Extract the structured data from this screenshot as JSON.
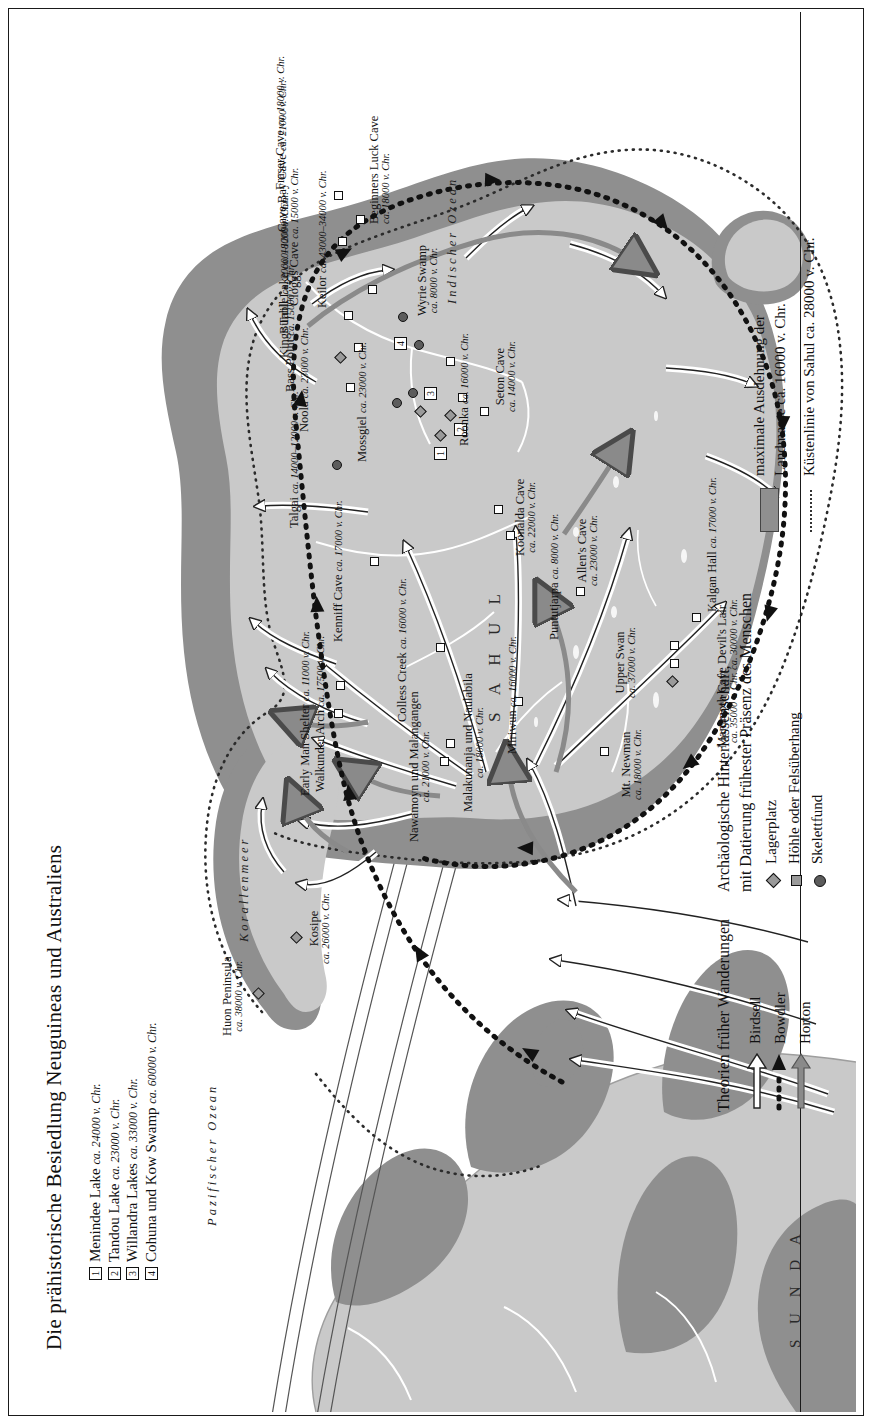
{
  "title": "Die prähistorische Besiedlung Neuguineas und Australiens",
  "numbered_list": [
    {
      "num": "1",
      "name": "Menindee Lake",
      "date": "ca. 24000 v. Chr."
    },
    {
      "num": "2",
      "name": "Tandou Lake",
      "date": "ca. 23000 v. Chr."
    },
    {
      "num": "3",
      "name": "Willandra Lakes",
      "date": "ca. 33000 v. Chr."
    },
    {
      "num": "4",
      "name": "Cohuna und Kow Swamp",
      "date": "ca. 60000 v. Chr."
    }
  ],
  "ocean_labels": {
    "pacific": "Pazifischer Ozean",
    "indian": "Indischer Ozean",
    "coral": "Korallenmeer"
  },
  "region_labels": {
    "sahul": "S A H U L",
    "sunda": "S U N D A"
  },
  "legend": {
    "migration_heading": "Theorien früher Wanderungen",
    "migration_items": [
      {
        "label": "Birdsell",
        "icon": "white-arrow-icon"
      },
      {
        "label": "Bowdler",
        "icon": "black-dotted-arrow-icon"
      },
      {
        "label": "Horton",
        "icon": "gray-arrow-icon"
      }
    ],
    "finds_heading_line1": "Archäologische Hinterlassenschaft,",
    "finds_heading_line2": "mit Datierung frühester Präsenz des Menschen",
    "finds_items": [
      {
        "label": "Lagerplatz",
        "icon": "diamond-marker-icon"
      },
      {
        "label": "Höhle oder Felsüberhang",
        "icon": "square-marker-icon"
      },
      {
        "label": "Skelettfund",
        "icon": "circle-marker-icon"
      }
    ],
    "landmass_line1": "maximale Ausdehnung der",
    "landmass_line2": "Landmasse ca. 16000 v. Chr.",
    "coastline": "Küstenlinie von Sahul ca. 28000 v. Chr."
  },
  "colors": {
    "land": "#c9c9c9",
    "shelf": "#8f8f8f",
    "ink": "#111111",
    "paper": "#ffffff"
  },
  "sites": [
    {
      "name": "Huon Peninsula",
      "date": "ca. 38000 v. Chr.",
      "type": "diamond"
    },
    {
      "name": "Kosipe",
      "date": "ca. 26000 v. Chr.",
      "type": "diamond"
    },
    {
      "name": "Early Man Shelter",
      "date": "ca. 11000 v. Chr.",
      "type": "square"
    },
    {
      "name": "Walkunder Arch",
      "date": "ca. 17500 v. Chr.",
      "type": "square"
    },
    {
      "name": "Kenniff Cave",
      "date": "ca. 17000 v. Chr.",
      "type": "square"
    },
    {
      "name": "Talgai",
      "date": "ca. 14000–12000 v. Chr.",
      "type": "circle"
    },
    {
      "name": "Noola",
      "date": "ca. 23000 v. Chr.",
      "type": "square"
    },
    {
      "name": "Bass Point",
      "date": "ca. 15000 v. Chr.",
      "type": "diamond"
    },
    {
      "name": "Kings Table",
      "date": "ca. 20000–12000 v. Chr.",
      "type": "square"
    },
    {
      "name": "Burrill Lake",
      "date": "ca. 18000 v. Chr.",
      "type": "square"
    },
    {
      "name": "Cloggs Cave",
      "date": "ca. 15000 v. Chr.",
      "type": "square"
    },
    {
      "name": "Keilor",
      "date": "ca. 43000–34000 v. Chr.",
      "type": "circle"
    },
    {
      "name": "Cave Bay Cave",
      "date": "ca. 21000 v. Chr.",
      "type": "square"
    },
    {
      "name": "Fraser Cave",
      "date": "ca. 18000 v. Chr.",
      "type": "square"
    },
    {
      "name": "Beginners Luck Cave",
      "date": "ca. 18000 v. Chr.",
      "type": "square"
    },
    {
      "name": "Mossgiel",
      "date": "ca. 23000 v. Chr.",
      "type": "circle"
    },
    {
      "name": "Wyrie Swamp",
      "date": "ca. 8000 v. Chr.",
      "type": "square"
    },
    {
      "name": "Roonka",
      "date": "ca. 16000 v. Chr.",
      "type": "square"
    },
    {
      "name": "Seton Cave",
      "date": "ca. 14000 v. Chr.",
      "type": "square"
    },
    {
      "name": "Koonalda Cave",
      "date": "ca. 22000 v. Chr.",
      "type": "square"
    },
    {
      "name": "Allen's Cave",
      "date": "ca. 23000 v. Chr.",
      "type": "square"
    },
    {
      "name": "Kalgan Hall",
      "date": "ca. 17000 v. Chr.",
      "type": "square"
    },
    {
      "name": "Upper Swan",
      "date": "ca. 37000 v. Chr.",
      "type": "diamond"
    },
    {
      "name": "Devil's Lair",
      "date": "ca. 30000 v. Chr.",
      "type": "square"
    },
    {
      "name": "Mammoth Cave",
      "date": "ca. 35000 v. Chr.",
      "type": "square"
    },
    {
      "name": "Mt. Newman",
      "date": "ca. 18000 v. Chr.",
      "type": "square"
    },
    {
      "name": "Puntutjarpa",
      "date": "ca. 8000 v. Chr.",
      "type": "square"
    },
    {
      "name": "Miriwun",
      "date": "ca. 16000 v. Chr.",
      "type": "square"
    },
    {
      "name": "Malakunanja und Naulabila",
      "date": "ca. 18000 v. Chr.",
      "type": "square"
    },
    {
      "name": "Nawamoyn und Malangangen",
      "date": "ca. 21000 v. Chr.",
      "type": "square"
    },
    {
      "name": "Colless Creek",
      "date": "ca. 16000 v. Chr.",
      "type": "square"
    }
  ]
}
